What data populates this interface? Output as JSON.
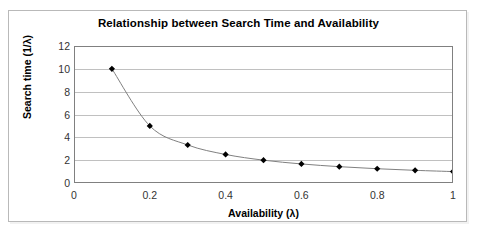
{
  "chart_data": {
    "type": "line",
    "title": "Relationship between Search Time and Availability",
    "xlabel": "Availability (λ)",
    "ylabel": "Search time (1/λ)",
    "xlim": [
      0,
      1
    ],
    "ylim": [
      0,
      12
    ],
    "grid": true,
    "legend": "none",
    "marker": "black-diamond",
    "line_color": "#808080",
    "marker_color": "#000000",
    "gridline_color": "#c0c0c0",
    "axis_color": "#808080",
    "x_ticks": [
      "0",
      "0.2",
      "0.4",
      "0.6",
      "0.8",
      "1"
    ],
    "x_tick_values": [
      0,
      0.2,
      0.4,
      0.6,
      0.8,
      1
    ],
    "y_ticks": [
      "0",
      "2",
      "4",
      "6",
      "8",
      "10",
      "12"
    ],
    "y_tick_values": [
      0,
      2,
      4,
      6,
      8,
      10,
      12
    ],
    "series": [
      {
        "name": "Search time",
        "x": [
          0.1,
          0.2,
          0.3,
          0.4,
          0.5,
          0.6,
          0.7,
          0.8,
          0.9,
          1.0
        ],
        "values": [
          10,
          5,
          3.33,
          2.5,
          2,
          1.67,
          1.43,
          1.25,
          1.11,
          1
        ]
      }
    ]
  }
}
